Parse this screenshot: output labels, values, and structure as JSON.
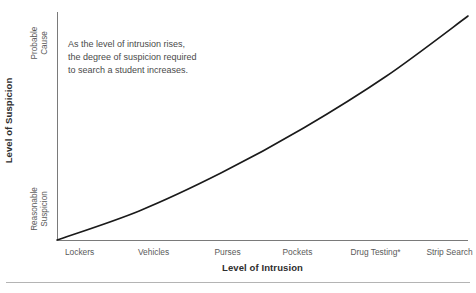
{
  "chart_data": {
    "type": "line",
    "title": "",
    "xlabel": "Level of Intrusion",
    "ylabel": "Level of Suspicion",
    "grid": false,
    "legend": "none",
    "categories": [
      "Lockers",
      "Vehicles",
      "Purses",
      "Pockets",
      "Drug Testing*",
      "Strip Search"
    ],
    "x": [
      0,
      1,
      2,
      3,
      4,
      5
    ],
    "values": [
      0,
      0.13,
      0.3,
      0.5,
      0.73,
      1.0
    ],
    "ylim": [
      0,
      1
    ],
    "ytick_positions": [
      0,
      1
    ],
    "ytick_labels": [
      "Reasonable Suspicion",
      "Probable Cause"
    ],
    "series": [
      {
        "name": "Required suspicion",
        "values": [
          0,
          0.13,
          0.3,
          0.5,
          0.73,
          1.0
        ]
      }
    ],
    "annotations": [
      "As the level of intrusion rises,",
      "the degree of suspicion required",
      "to search a student increases."
    ],
    "curve_color": "#1a1a1a",
    "axis_color": "#7a7a7a"
  },
  "axes": {
    "y_title": "Level of Suspicion",
    "x_title": "Level of Intrusion",
    "y_tick_high_line1": "Probable",
    "y_tick_high_line2": "Cause",
    "y_tick_low_line1": "Reasonable",
    "y_tick_low_line2": "Suspicion"
  },
  "x_ticks": [
    {
      "label": "Lockers",
      "pos_pct": 5.5
    },
    {
      "label": "Vehicles",
      "pos_pct": 23.5
    },
    {
      "label": "Purses",
      "pos_pct": 41.5
    },
    {
      "label": "Pockets",
      "pos_pct": 58.5
    },
    {
      "label": "Drug Testing*",
      "pos_pct": 77.5
    },
    {
      "label": "Strip Search",
      "pos_pct": 95.5
    }
  ],
  "annotation": {
    "line1": "As the level of intrusion rises,",
    "line2": "the degree of suspicion required",
    "line3": "to search a student increases."
  }
}
